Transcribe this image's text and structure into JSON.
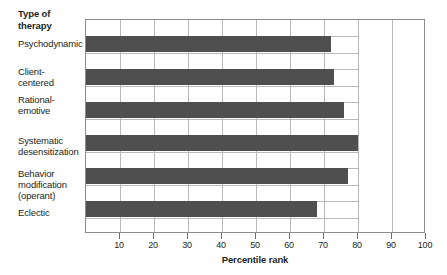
{
  "chart_data": {
    "type": "bar",
    "orientation": "horizontal",
    "title": "",
    "xlabel": "Percentile rank",
    "ylabel": "Type of therapy",
    "categories": [
      "Psychodynamic",
      "Client-\ncentered",
      "Rational-\nemotive",
      "Systematic\ndesensitization",
      "Behavior\nmodification\n(operant)",
      "Eclectic"
    ],
    "values": [
      72,
      73,
      76,
      80,
      77,
      68
    ],
    "xlim": [
      0,
      100
    ],
    "xticks": [
      10,
      20,
      30,
      40,
      50,
      60,
      70,
      80,
      90,
      100
    ],
    "xtick_labels": [
      "10",
      "20",
      "30",
      "40",
      "50",
      "60",
      "70",
      "80",
      "90",
      "100"
    ],
    "grid": true,
    "legend": "none",
    "bar_color": "#4f4f4f",
    "grid_color": "#b9b9b9",
    "frame_color": "#8d8d8d",
    "text_color": "#231f20",
    "background": "#ffffff"
  },
  "axis": {
    "y_title_line1": "Type of",
    "y_title_line2": "therapy",
    "x_title": "Percentile rank"
  },
  "labels": [
    {
      "lines": [
        "Psychodynamic"
      ]
    },
    {
      "lines": [
        "Client-",
        "centered"
      ]
    },
    {
      "lines": [
        "Rational-",
        "emotive"
      ]
    },
    {
      "lines": [
        "Systematic",
        "desensitization"
      ]
    },
    {
      "lines": [
        "Behavior",
        "modification",
        "(operant)"
      ]
    },
    {
      "lines": [
        "Eclectic"
      ]
    }
  ]
}
